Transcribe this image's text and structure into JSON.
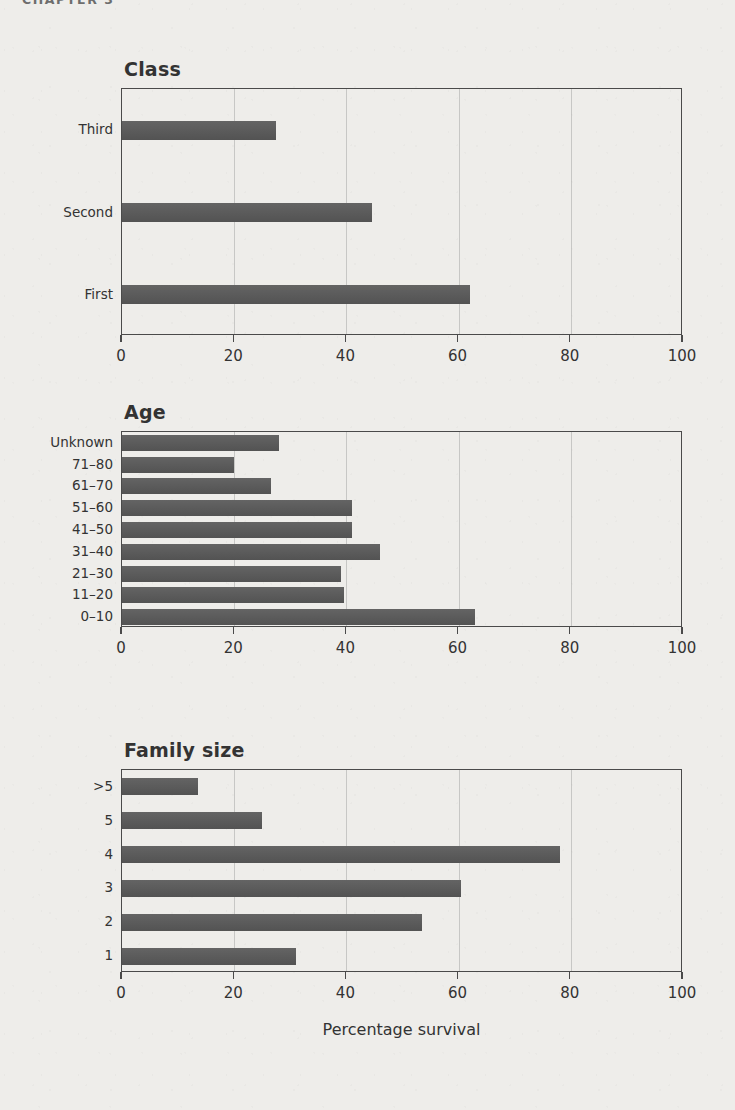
{
  "running_head": "CHAPTER 3",
  "axis_title": "Percentage survival",
  "colors": {
    "bar": "#585858",
    "axis": "#4a4a4a",
    "text": "#333333",
    "background": "#eeedea"
  },
  "chart_data": [
    {
      "type": "bar",
      "orientation": "horizontal",
      "title": "Class",
      "xlabel": "",
      "ylabel": "",
      "xlim": [
        0,
        100
      ],
      "xticks": [
        0,
        20,
        40,
        60,
        80,
        100
      ],
      "xticklabels": [
        "0",
        "20",
        "40",
        "60",
        "80",
        "100"
      ],
      "grid": "vertical",
      "legend": "none",
      "categories": [
        "Third",
        "Second",
        "First"
      ],
      "values": [
        27.5,
        44.5,
        62.0
      ]
    },
    {
      "type": "bar",
      "orientation": "horizontal",
      "title": "Age",
      "xlabel": "",
      "ylabel": "",
      "xlim": [
        0,
        100
      ],
      "xticks": [
        0,
        20,
        40,
        60,
        80,
        100
      ],
      "xticklabels": [
        "0",
        "20",
        "40",
        "60",
        "80",
        "100"
      ],
      "grid": "vertical",
      "legend": "none",
      "categories": [
        "Unknown",
        "71–80",
        "61–70",
        "51–60",
        "41–50",
        "31–40",
        "21–30",
        "11–20",
        "0–10"
      ],
      "values": [
        28.0,
        20.0,
        26.5,
        41.0,
        41.0,
        46.0,
        39.0,
        39.5,
        63.0
      ]
    },
    {
      "type": "bar",
      "orientation": "horizontal",
      "title": "Family size",
      "xlabel": "Percentage survival",
      "ylabel": "",
      "xlim": [
        0,
        100
      ],
      "xticks": [
        0,
        20,
        40,
        60,
        80,
        100
      ],
      "xticklabels": [
        "0",
        "20",
        "40",
        "60",
        "80",
        "100"
      ],
      "grid": "vertical",
      "legend": "none",
      "categories": [
        ">5",
        "5",
        "4",
        "3",
        "2",
        "1"
      ],
      "values": [
        13.5,
        25.0,
        78.0,
        60.5,
        53.5,
        31.0
      ]
    }
  ]
}
